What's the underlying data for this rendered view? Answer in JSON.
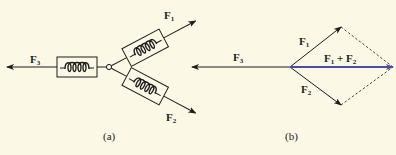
{
  "figure": {
    "panel_a": {
      "caption": "(a)",
      "labels": {
        "f1": {
          "base": "F",
          "sub": "1"
        },
        "f2": {
          "base": "F",
          "sub": "2"
        },
        "f3": {
          "base": "F",
          "sub": "3"
        }
      },
      "components": [
        "spring-scale-f3",
        "spring-scale-f1",
        "spring-scale-f2",
        "junction-ring"
      ]
    },
    "panel_b": {
      "caption": "(b)",
      "labels": {
        "f1": {
          "base": "F",
          "sub": "1"
        },
        "f2": {
          "base": "F",
          "sub": "2"
        },
        "f3": {
          "base": "F",
          "sub": "3"
        },
        "resultant": {
          "a": "F",
          "a_sub": "1",
          "op": " + ",
          "b": "F",
          "b_sub": "2"
        }
      }
    },
    "colors": {
      "background": "#fbf8e6",
      "ink": "#1c1c1c",
      "resultant": "#4a4fa6"
    }
  }
}
